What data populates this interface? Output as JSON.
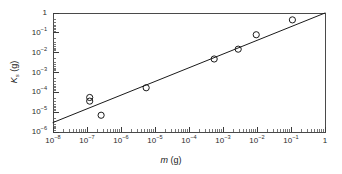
{
  "chart_data": {
    "type": "scatter",
    "title": "",
    "xlabel": "m (g)",
    "ylabel": "K_s (g)",
    "xscale": "log",
    "yscale": "log",
    "xlim": [
      1e-08,
      1
    ],
    "ylim": [
      1e-06,
      1
    ],
    "grid": false,
    "legend": null,
    "xtick_labels": [
      "10-8",
      "10-7",
      "10-6",
      "10-5",
      "10-4",
      "10-3",
      "10-2",
      "10-1",
      "1"
    ],
    "xtick_values": [
      1e-08,
      1e-07,
      1e-06,
      1e-05,
      0.0001,
      0.001,
      0.01,
      0.1,
      1
    ],
    "ytick_labels": [
      "10-6",
      "10-5",
      "10-4",
      "10-3",
      "10-2",
      "10-1",
      "1"
    ],
    "ytick_values": [
      1e-06,
      1e-05,
      0.0001,
      0.001,
      0.01,
      0.1,
      1
    ],
    "minor_ticks": true,
    "series": [
      {
        "name": "measurements",
        "marker": "open-circle",
        "marker_size_px": 6.2,
        "color": "#1a1a1a",
        "points": [
          {
            "x": 1.2e-07,
            "y": 5.5e-05
          },
          {
            "x": 1.2e-07,
            "y": 3.6e-05
          },
          {
            "x": 2.6e-07,
            "y": 7e-06
          },
          {
            "x": 5.5e-06,
            "y": 0.00017
          },
          {
            "x": 0.00055,
            "y": 0.0048
          },
          {
            "x": 0.0028,
            "y": 0.015
          },
          {
            "x": 0.0095,
            "y": 0.08
          },
          {
            "x": 0.11,
            "y": 0.45
          }
        ]
      },
      {
        "name": "power-law fit",
        "type": "line",
        "color": "#1a1a1a",
        "line_width_px": 1,
        "endpoints": [
          {
            "x": 1e-08,
            "y": 3e-06
          },
          {
            "x": 1.0,
            "y": 1.0
          }
        ],
        "slope": 0.687
      }
    ]
  },
  "axes": {
    "x_title_var": "m",
    "x_title_unit": " (g)",
    "y_title_var": "K",
    "y_title_sub": "s",
    "y_title_unit": " (g)"
  },
  "colors": {
    "axis": "#3a3a3a",
    "data": "#1a1a1a",
    "background": "#ffffff"
  }
}
